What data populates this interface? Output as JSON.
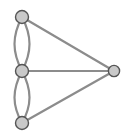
{
  "figure": {
    "width": 131,
    "height": 140,
    "background_color": "#ffffff"
  },
  "style": {
    "node_fill": "#c9c9c9",
    "node_stroke": "#555555",
    "node_stroke_width": 1.4,
    "edge_color": "#8c8c8c",
    "edge_width": 2.2
  },
  "chart_data": {
    "type": "diagram",
    "diagram_kind": "graph",
    "directed": false,
    "multigraph": true,
    "node_count": 4,
    "edge_count": 7,
    "nodes": [
      {
        "id": "n1",
        "label": "",
        "name": "top-node",
        "x": 22,
        "y": 17,
        "r": 6.5
      },
      {
        "id": "n2",
        "label": "",
        "name": "middle-node",
        "x": 22,
        "y": 71,
        "r": 6.5
      },
      {
        "id": "n3",
        "label": "",
        "name": "bottom-node",
        "x": 22,
        "y": 123,
        "r": 6.5
      },
      {
        "id": "n4",
        "label": "",
        "name": "right-node",
        "x": 114,
        "y": 71,
        "r": 5.6
      }
    ],
    "edges": [
      {
        "id": "e1",
        "source": "n1",
        "target": "n2",
        "kind": "curved",
        "bend": -7,
        "label": ""
      },
      {
        "id": "e2",
        "source": "n1",
        "target": "n2",
        "kind": "curved",
        "bend": 7,
        "label": ""
      },
      {
        "id": "e3",
        "source": "n2",
        "target": "n3",
        "kind": "curved",
        "bend": -7,
        "label": ""
      },
      {
        "id": "e4",
        "source": "n2",
        "target": "n3",
        "kind": "curved",
        "bend": 7,
        "label": ""
      },
      {
        "id": "e5",
        "source": "n1",
        "target": "n4",
        "kind": "straight",
        "bend": 0,
        "label": ""
      },
      {
        "id": "e6",
        "source": "n2",
        "target": "n4",
        "kind": "straight",
        "bend": 0,
        "label": ""
      },
      {
        "id": "e7",
        "source": "n3",
        "target": "n4",
        "kind": "straight",
        "bend": 0,
        "label": ""
      }
    ],
    "edge_paths": [
      {
        "name": "edge-top-middle-left",
        "d": "M 22 17 C 12 36, 12 52, 22 71"
      },
      {
        "name": "edge-top-middle-right",
        "d": "M 22 17 C 32 36, 32 52, 22 71"
      },
      {
        "name": "edge-middle-bottom-left",
        "d": "M 22 71 C 12 90, 12 105, 22 123"
      },
      {
        "name": "edge-middle-bottom-right",
        "d": "M 22 71 C 32 90, 32 105, 22 123"
      },
      {
        "name": "edge-top-right",
        "d": "M 22 17 L 114 71"
      },
      {
        "name": "edge-middle-right",
        "d": "M 22 71 L 114 71"
      },
      {
        "name": "edge-bottom-right",
        "d": "M 22 123 L 114 71"
      }
    ]
  }
}
